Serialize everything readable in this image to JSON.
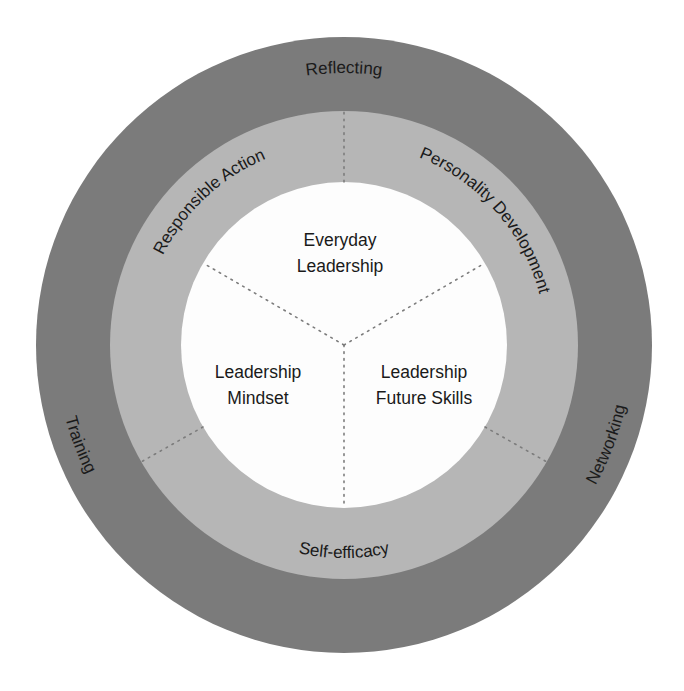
{
  "diagram": {
    "type": "concentric-rings",
    "colors": {
      "outer_ring": "#7b7b7b",
      "middle_ring": "#b6b6b6",
      "inner_circle": "#fdfdfd",
      "text": "#1a1a1a",
      "divider": "#7c7c7c"
    },
    "outer_ring": {
      "labels": {
        "top": "Reflecting",
        "left": "Training",
        "right": "Networking"
      }
    },
    "middle_ring": {
      "labels": {
        "upper_left": "Responsible Action",
        "upper_right": "Personality Development",
        "bottom": "Self-efficacy"
      }
    },
    "inner_circle": {
      "segments": {
        "top": {
          "line1": "Everyday",
          "line2": "Leadership"
        },
        "left": {
          "line1": "Leadership",
          "line2": "Mindset"
        },
        "right": {
          "line1": "Leadership",
          "line2": "Future Skills"
        }
      }
    }
  }
}
